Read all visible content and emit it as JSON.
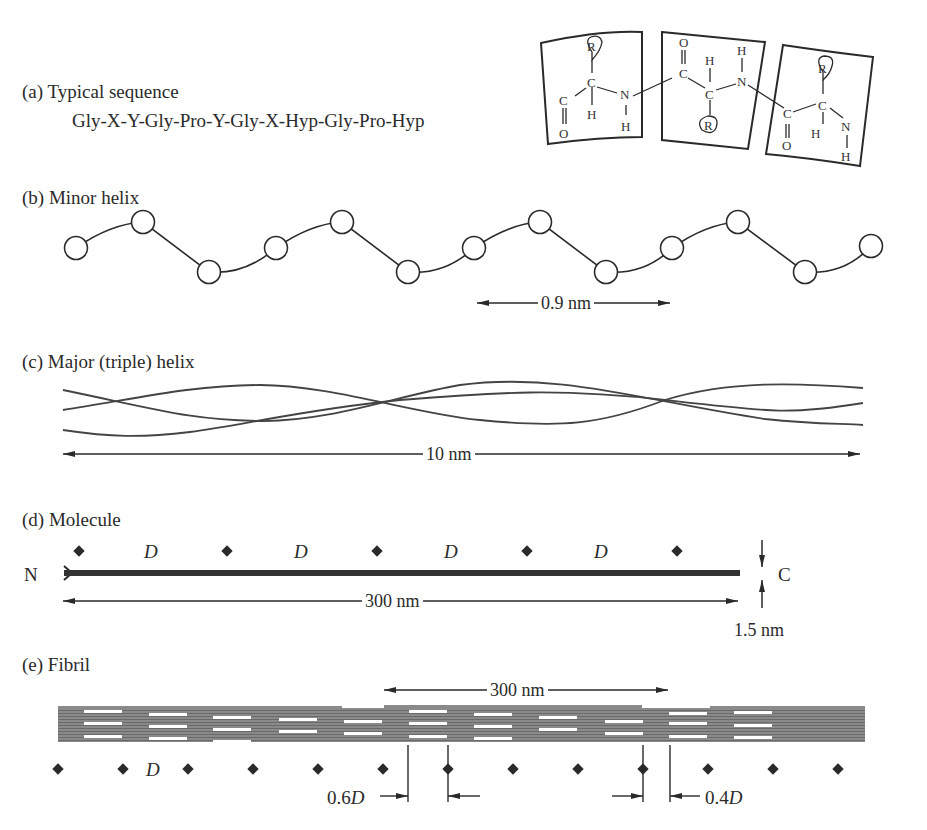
{
  "panels": {
    "a": {
      "label": "(a)  Typical sequence",
      "sequence": "Gly-X-Y-Gly-Pro-Y-Gly-X-Hyp-Gly-Pro-Hyp",
      "residue_boxes": [
        {
          "atoms": [
            "R",
            "C",
            "C",
            "O",
            "H",
            "N",
            "H"
          ]
        },
        {
          "atoms": [
            "O",
            "C",
            "H",
            "C",
            "R",
            "N",
            "H"
          ]
        },
        {
          "atoms": [
            "R",
            "C",
            "C",
            "O",
            "H",
            "N",
            "H"
          ]
        }
      ]
    },
    "b": {
      "label": "(b)  Minor helix",
      "dimension": "0.9 nm",
      "residue_count": 13
    },
    "c": {
      "label": "(c) Major (triple) helix",
      "dimension": "10 nm",
      "strand_count": 3
    },
    "d": {
      "label": "(d) Molecule",
      "n_terminus": "N",
      "c_terminus": "C",
      "length": "300 nm",
      "width": "1.5 nm",
      "period_labels": [
        "D",
        "D",
        "D",
        "D"
      ]
    },
    "e": {
      "label": "(e) Fibril",
      "length": "300 nm",
      "period_label": "D",
      "gap_label": "0.6D",
      "overlap_label": "0.4D",
      "gap_prefix": "0.6",
      "overlap_prefix": "0.4",
      "d_symbol": "D"
    }
  },
  "colors": {
    "ink": "#2a2a2a",
    "fibril": "#7d7d7d",
    "background": "#ffffff"
  }
}
